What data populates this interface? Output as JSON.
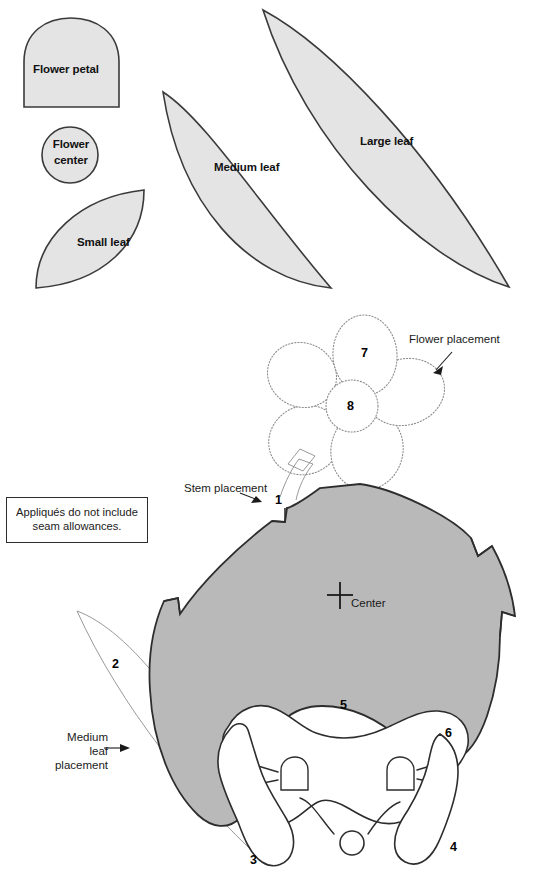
{
  "page": {
    "background": "#ffffff",
    "width": 539,
    "height": 890
  },
  "colors": {
    "piece_fill": "#e4e4e4",
    "egg_fill": "#b9b9b9",
    "white_fill": "#ffffff",
    "outline": "#2d2d2d",
    "dotted_guide": "#8d8d8d",
    "text": "#111111"
  },
  "template_pieces": [
    {
      "id": "flower-petal",
      "label": "Flower petal",
      "shape": "dome"
    },
    {
      "id": "flower-center",
      "label": "Flower center",
      "label_line1": "Flower",
      "label_line2": "center",
      "shape": "circle"
    },
    {
      "id": "small-leaf",
      "label": "Small leaf",
      "shape": "leaf"
    },
    {
      "id": "medium-leaf",
      "label": "Medium leaf",
      "shape": "leaf"
    },
    {
      "id": "large-leaf",
      "label": "Large leaf",
      "shape": "leaf"
    }
  ],
  "note": {
    "line1": "Appliqués do not include",
    "line2": "seam allowances.",
    "full": "Appliqués do not include seam allowances."
  },
  "annotations": [
    {
      "id": "flower-placement",
      "label": "Flower placement",
      "has_arrow": true
    },
    {
      "id": "stem-placement",
      "label": "Stem placement",
      "has_arrow": true
    },
    {
      "id": "medium-leaf-placement",
      "label": "Medium leaf placement",
      "line1": "Medium",
      "line2": "leaf",
      "line3": "placement",
      "has_arrow": true
    },
    {
      "id": "center-mark",
      "label": "Center",
      "has_arrow": false,
      "marker": "cross"
    }
  ],
  "placement_numbers": [
    {
      "id": "piece-1",
      "value": "1",
      "refers_to": "stem"
    },
    {
      "id": "piece-2",
      "value": "2",
      "refers_to": "medium leaf"
    },
    {
      "id": "piece-3",
      "value": "3",
      "refers_to": "left foot"
    },
    {
      "id": "piece-4",
      "value": "4",
      "refers_to": "right foot"
    },
    {
      "id": "piece-5",
      "value": "5",
      "refers_to": "egg body"
    },
    {
      "id": "piece-6",
      "value": "6",
      "refers_to": "bunny head"
    },
    {
      "id": "piece-7",
      "value": "7",
      "refers_to": "flower petal"
    },
    {
      "id": "piece-8",
      "value": "8",
      "refers_to": "flower center"
    }
  ],
  "flower": {
    "petal_count": 5,
    "petal_number": "7",
    "center_number": "8",
    "style": "dotted placement guide"
  }
}
